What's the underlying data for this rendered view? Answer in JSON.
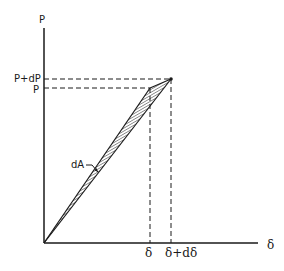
{
  "diagram": {
    "axes": {
      "y_label": "P",
      "x_label": "δ"
    },
    "y_ticks": [
      {
        "label": "P+dP"
      },
      {
        "label": "P"
      }
    ],
    "x_ticks": [
      {
        "label": "δ"
      },
      {
        "label": "δ+dδ"
      }
    ],
    "area_label": "dA",
    "colors": {
      "ink": "#1a1a1a",
      "background": "#ffffff"
    }
  }
}
